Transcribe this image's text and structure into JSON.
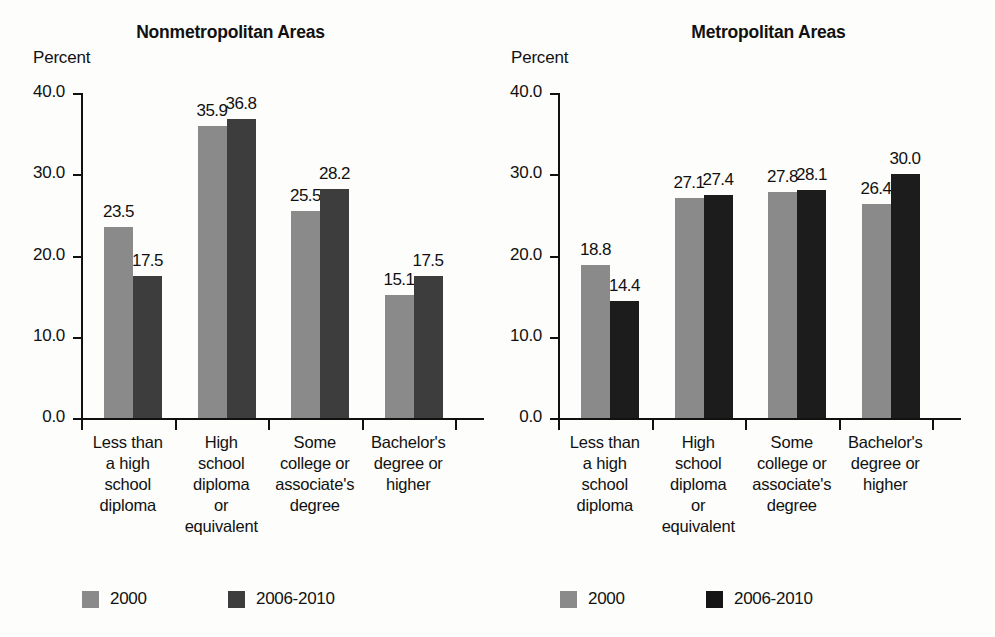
{
  "figure": {
    "background_color": "#fdfdfb",
    "panels": [
      {
        "id": "nonmetropolitan",
        "title": "Nonmetropolitan Areas",
        "axis_unit_label": "Percent",
        "series_colors": {
          "2000": "#8a8a8a",
          "2006-2010": "#3d3d3d"
        }
      },
      {
        "id": "metropolitan",
        "title": "Metropolitan Areas",
        "axis_unit_label": "Percent",
        "series_colors": {
          "2000": "#8a8a8a",
          "2006-2010": "#1c1c1c"
        }
      }
    ]
  },
  "chart_data": [
    {
      "type": "bar",
      "title": "Nonmetropolitan Areas",
      "xlabel": "",
      "ylabel": "Percent",
      "ylim": [
        0,
        40
      ],
      "yticks": [
        0.0,
        10.0,
        20.0,
        30.0,
        40.0
      ],
      "ytick_labels": [
        "0.0",
        "10.0",
        "20.0",
        "30.0",
        "40.0"
      ],
      "grid": false,
      "legend_position": "bottom-left",
      "categories": [
        "Less than\na high\nschool\ndiploma",
        "High\nschool\ndiploma\nor\nequivalent",
        "Some\ncollege or\nassociate's\ndegree",
        "Bachelor's\ndegree or\nhigher"
      ],
      "series": [
        {
          "name": "2000",
          "color": "#8a8a8a",
          "values": [
            23.5,
            35.9,
            25.5,
            15.1
          ],
          "value_labels": [
            "23.5",
            "35.9",
            "25.5",
            "15.1"
          ]
        },
        {
          "name": "2006-2010",
          "color": "#3d3d3d",
          "values": [
            17.5,
            36.8,
            28.2,
            17.5
          ],
          "value_labels": [
            "17.5",
            "36.8",
            "28.2",
            "17.5"
          ]
        }
      ]
    },
    {
      "type": "bar",
      "title": "Metropolitan Areas",
      "xlabel": "",
      "ylabel": "Percent",
      "ylim": [
        0,
        40
      ],
      "yticks": [
        0.0,
        10.0,
        20.0,
        30.0,
        40.0
      ],
      "ytick_labels": [
        "0.0",
        "10.0",
        "20.0",
        "30.0",
        "40.0"
      ],
      "grid": false,
      "legend_position": "bottom-left",
      "categories": [
        "Less than\na high\nschool\ndiploma",
        "High\nschool\ndiploma\nor\nequivalent",
        "Some\ncollege or\nassociate's\ndegree",
        "Bachelor's\ndegree or\nhigher"
      ],
      "series": [
        {
          "name": "2000",
          "color": "#8a8a8a",
          "values": [
            18.8,
            27.1,
            27.8,
            26.4
          ],
          "value_labels": [
            "18.8",
            "27.1",
            "27.8",
            "26.4"
          ]
        },
        {
          "name": "2006-2010",
          "color": "#1c1c1c",
          "values": [
            14.4,
            27.4,
            28.1,
            30.0
          ],
          "value_labels": [
            "14.4",
            "27.4",
            "28.1",
            "30.0"
          ]
        }
      ]
    }
  ],
  "legend": {
    "entries": [
      {
        "label": "2000",
        "swatch": "gray"
      },
      {
        "label": "2006-2010",
        "swatch": "dark"
      }
    ]
  }
}
